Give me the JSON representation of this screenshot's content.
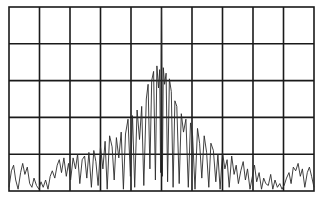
{
  "chart_data": {
    "type": "line",
    "title": "",
    "xlabel": "",
    "ylabel": "",
    "grid": true,
    "legend": null,
    "divisions": {
      "x": 10,
      "y": 5
    },
    "xlim": [
      0,
      10
    ],
    "ylim": [
      0,
      5
    ],
    "plot_area_px": {
      "left": 9,
      "top": 7,
      "right": 314,
      "bottom": 191
    },
    "series": [
      {
        "name": "spectrum",
        "x": [
          0.0,
          0.08,
          0.15,
          0.22,
          0.3,
          0.38,
          0.45,
          0.52,
          0.6,
          0.68,
          0.75,
          0.82,
          0.9,
          0.98,
          1.05,
          1.12,
          1.2,
          1.28,
          1.35,
          1.42,
          1.5,
          1.58,
          1.65,
          1.72,
          1.8,
          1.88,
          1.95,
          2.02,
          2.1,
          2.18,
          2.25,
          2.32,
          2.4,
          2.48,
          2.55,
          2.62,
          2.7,
          2.78,
          2.85,
          2.92,
          3.0,
          3.08,
          3.15,
          3.22,
          3.3,
          3.38,
          3.45,
          3.52,
          3.6,
          3.68,
          3.75,
          3.82,
          3.9,
          3.98,
          4.05,
          4.12,
          4.2,
          4.28,
          4.35,
          4.42,
          4.5,
          4.56,
          4.62,
          4.68,
          4.74,
          4.8,
          4.85,
          4.9,
          4.94,
          4.97,
          5.0,
          5.03,
          5.06,
          5.1,
          5.15,
          5.2,
          5.26,
          5.32,
          5.38,
          5.44,
          5.5,
          5.58,
          5.65,
          5.72,
          5.8,
          5.88,
          5.95,
          6.02,
          6.1,
          6.18,
          6.25,
          6.32,
          6.4,
          6.48,
          6.55,
          6.62,
          6.7,
          6.78,
          6.85,
          6.92,
          7.0,
          7.08,
          7.15,
          7.22,
          7.3,
          7.38,
          7.45,
          7.52,
          7.6,
          7.68,
          7.75,
          7.82,
          7.9,
          7.98,
          8.05,
          8.12,
          8.2,
          8.28,
          8.35,
          8.42,
          8.5,
          8.58,
          8.65,
          8.72,
          8.8,
          8.88,
          8.95,
          9.02,
          9.1,
          9.18,
          9.25,
          9.32,
          9.4,
          9.48,
          9.55,
          9.62,
          9.7,
          9.78,
          9.85,
          9.92,
          10.0
        ],
        "values": [
          0.1,
          0.55,
          0.7,
          0.3,
          0.05,
          0.5,
          0.75,
          0.45,
          0.65,
          0.2,
          0.1,
          0.35,
          0.15,
          0.05,
          0.25,
          0.1,
          0.3,
          0.05,
          0.4,
          0.55,
          0.35,
          0.7,
          0.85,
          0.5,
          0.9,
          0.4,
          0.75,
          0.3,
          0.9,
          0.6,
          1.0,
          0.2,
          0.85,
          0.95,
          0.35,
          1.05,
          0.1,
          1.1,
          0.8,
          0.15,
          1.2,
          0.6,
          1.35,
          0.05,
          1.5,
          1.2,
          0.3,
          1.45,
          0.9,
          1.6,
          0.05,
          1.55,
          1.95,
          0.4,
          2.05,
          0.1,
          2.2,
          1.4,
          2.3,
          0.15,
          2.5,
          2.9,
          0.6,
          3.0,
          3.25,
          0.3,
          3.4,
          2.8,
          3.3,
          0.5,
          4.95,
          0.4,
          3.35,
          2.9,
          3.2,
          0.25,
          3.05,
          2.7,
          0.1,
          2.45,
          2.3,
          0.2,
          2.1,
          1.6,
          1.95,
          0.1,
          1.85,
          1.5,
          0.05,
          1.7,
          1.3,
          0.35,
          1.5,
          1.05,
          0.1,
          1.3,
          1.1,
          0.25,
          1.0,
          0.05,
          1.05,
          0.6,
          0.85,
          0.1,
          0.95,
          0.45,
          0.7,
          0.2,
          0.55,
          0.8,
          0.3,
          0.6,
          0.05,
          0.4,
          0.7,
          0.25,
          0.5,
          0.05,
          0.35,
          0.2,
          0.15,
          0.45,
          0.05,
          0.3,
          0.1,
          0.2,
          0.05,
          0.15,
          0.35,
          0.5,
          0.2,
          0.65,
          0.55,
          0.75,
          0.4,
          0.6,
          0.1,
          0.5,
          0.65,
          0.4,
          0.1
        ]
      }
    ]
  }
}
